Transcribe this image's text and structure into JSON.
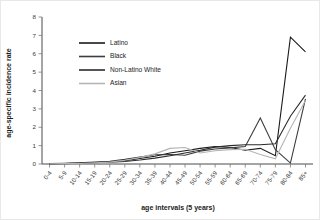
{
  "chart_data": {
    "type": "line",
    "title": "",
    "xlabel": "age intervals (5 years)",
    "ylabel": "age-specific incidence rate",
    "categories": [
      "0-4",
      "5-9",
      "10-14",
      "15-19",
      "20-24",
      "25-29",
      "30-34",
      "35-39",
      "40-44",
      "45-49",
      "50-54",
      "55-59",
      "60-64",
      "65-69",
      "70-74",
      "75-79",
      "80-84",
      "85+"
    ],
    "yticks": [
      0,
      1,
      2,
      3,
      4,
      5,
      6,
      7,
      8
    ],
    "ylim": [
      0,
      8
    ],
    "grid": false,
    "legend_position": "upper-left-inside",
    "series": [
      {
        "name": "Latino",
        "color": "#1a1a1a",
        "values": [
          0.02,
          0.03,
          0.05,
          0.08,
          0.12,
          0.18,
          0.3,
          0.42,
          0.6,
          0.72,
          0.85,
          0.95,
          0.9,
          0.75,
          0.85,
          0.45,
          6.9,
          6.1
        ]
      },
      {
        "name": "Black",
        "color": "#3d3d3d",
        "values": [
          0.02,
          0.04,
          0.06,
          0.1,
          0.15,
          0.25,
          0.38,
          0.5,
          0.52,
          0.48,
          0.7,
          0.82,
          0.88,
          0.95,
          2.5,
          0.78,
          0.05,
          3.55
        ]
      },
      {
        "name": "Non-Latino White",
        "color": "#2b2b2b",
        "values": [
          0.01,
          0.02,
          0.04,
          0.07,
          0.1,
          0.14,
          0.22,
          0.32,
          0.45,
          0.6,
          0.75,
          0.92,
          1.0,
          1.05,
          1.05,
          1.1,
          2.6,
          3.75
        ]
      },
      {
        "name": "Asian",
        "color": "#b5b5b5",
        "values": [
          0.01,
          0.02,
          0.03,
          0.06,
          0.1,
          0.2,
          0.35,
          0.55,
          0.85,
          0.9,
          0.6,
          0.72,
          0.78,
          0.8,
          0.52,
          0.28,
          1.95,
          3.45
        ]
      }
    ]
  }
}
